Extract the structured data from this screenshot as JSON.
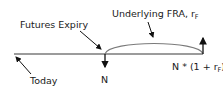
{
  "diagram": {
    "labels": {
      "futures_expiry": "Futures Expiry",
      "underlying_fra": "Underlying FRA, r",
      "underlying_fra_sub": "F",
      "today": "Today",
      "notional_out": "N",
      "notional_in": "N * (1 + r",
      "notional_in_sub": "F",
      "notional_in_close": ")"
    },
    "colors": {
      "line": "#7a7a7a",
      "arrow": "#111111",
      "text": "#1a1a1a"
    }
  }
}
